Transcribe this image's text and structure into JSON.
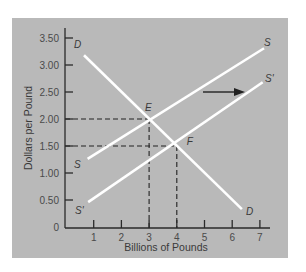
{
  "chart_data": {
    "type": "line",
    "title": "",
    "xlabel": "Billions of Pounds",
    "ylabel": "Dollars per Pound",
    "xlim": [
      0,
      7
    ],
    "ylim": [
      0,
      3.5
    ],
    "x_ticks": [
      "1",
      "2",
      "3",
      "4",
      "5",
      "6",
      "7"
    ],
    "y_ticks": [
      "0",
      "0.50",
      "1.00",
      "1.50",
      "2.00",
      "2.50",
      "3.00",
      "3.50"
    ],
    "grid": false,
    "legend": "none",
    "background_color": "#b9b9b9",
    "line_color": "#ffffff",
    "series": [
      {
        "name": "D",
        "label_start": "D",
        "label_end": "D",
        "points": [
          [
            0.65,
            3.18
          ],
          [
            6.35,
            0.33
          ]
        ]
      },
      {
        "name": "S",
        "label_start": "S",
        "label_end": "S",
        "points": [
          [
            0.78,
            1.26
          ],
          [
            7.15,
            3.31
          ]
        ]
      },
      {
        "name": "S'",
        "label_start": "S'",
        "label_end": "S'",
        "points": [
          [
            0.8,
            0.46
          ],
          [
            7.1,
            2.68
          ]
        ]
      }
    ],
    "annotations": [
      {
        "label": "E",
        "x": 3,
        "y": 2.0,
        "guides": "dashed"
      },
      {
        "label": "F",
        "x": 4,
        "y": 1.5,
        "guides": "dashed"
      },
      {
        "type": "arrow",
        "direction": "right",
        "from": [
          5.0,
          2.5
        ],
        "to": [
          6.4,
          2.5
        ],
        "meaning": "supply shift S to S'"
      }
    ]
  }
}
